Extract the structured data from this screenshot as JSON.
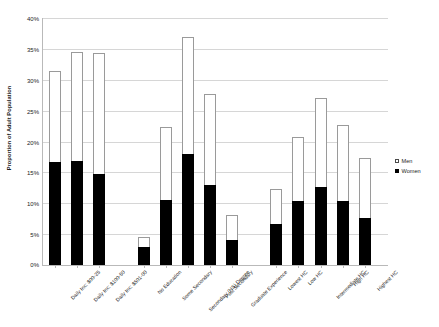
{
  "chart_data": {
    "type": "bar",
    "subtype": "stacked",
    "title": "",
    "xlabel": "",
    "ylabel": "Proportion of Adult Population",
    "ylim": [
      0,
      40
    ],
    "ytick_labels": [
      "0%",
      "5%",
      "10%",
      "15%",
      "20%",
      "25%",
      "30%",
      "35%",
      "40%"
    ],
    "ytick_values": [
      0,
      5,
      10,
      15,
      20,
      25,
      30,
      35,
      40
    ],
    "grid": true,
    "legend_position": "right",
    "categories": [
      "Daily Inc: $00-25",
      "Daily Inc: $100-50",
      "Daily Inc: $501-00",
      "No Education",
      "Some Secondary",
      "Secondary (HS) Degree",
      "Post Secondary",
      "Graduate Experience",
      "Lowest HC",
      "Low HC",
      "Intermediate HC",
      "High HC",
      "Highest HC"
    ],
    "series": [
      {
        "name": "Women",
        "color": "#000000",
        "values": [
          16.7,
          16.9,
          14.7,
          2.9,
          10.6,
          17.9,
          13.0,
          4.1,
          6.6,
          10.4,
          12.6,
          10.3,
          7.6
        ]
      },
      {
        "name": "Men",
        "color": "#ffffff",
        "values": [
          14.8,
          17.6,
          19.7,
          1.7,
          11.8,
          19.1,
          14.7,
          4.0,
          5.7,
          10.4,
          14.5,
          12.4,
          9.8
        ]
      }
    ],
    "totals": [
      31.5,
      34.5,
      34.4,
      4.6,
      22.4,
      37.0,
      27.7,
      8.1,
      12.3,
      20.8,
      27.1,
      22.7,
      17.4
    ],
    "group_gaps_after": [
      2,
      7
    ]
  },
  "legend": {
    "entries": [
      {
        "label": "Men",
        "marker": "open-square"
      },
      {
        "label": "Women",
        "marker": "filled-square"
      }
    ]
  },
  "axis": {
    "y_title": "Proportion of Adult Population"
  }
}
